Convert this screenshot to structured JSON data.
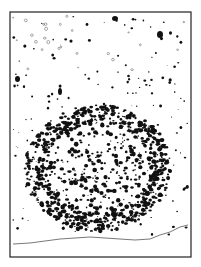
{
  "figure": {
    "type": "stone-distribution-plan",
    "frame": {
      "x": 10,
      "y": 12,
      "width": 181,
      "height": 245,
      "stroke": "#222222"
    },
    "colors": {
      "stone": "#111111",
      "outline_stone": "#555555",
      "profile": "#555555",
      "background": "#ffffff"
    },
    "cluster": {
      "cx": 98,
      "cy": 168,
      "rx": 72,
      "ry": 62
    },
    "large_stones": [
      {
        "x": 112,
        "y": 16,
        "w": 6,
        "h": 5
      },
      {
        "x": 157,
        "y": 31,
        "w": 6,
        "h": 7
      },
      {
        "x": 58,
        "y": 88,
        "w": 4,
        "h": 7
      },
      {
        "x": 15,
        "y": 76,
        "w": 5,
        "h": 6
      }
    ],
    "profile_points": "13,244 30,243 45,241 60,239 75,238 90,237 105,238 120,239 135,240 150,239 160,235 170,232 180,227 188,225"
  }
}
